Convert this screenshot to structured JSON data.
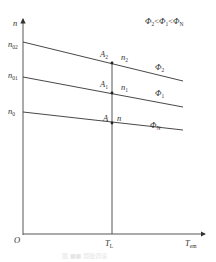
{
  "diagram": {
    "type": "mechanical-characteristic-curves",
    "axes": {
      "y_label": "n",
      "x_label_main": "T",
      "x_label_sub": "em",
      "origin_label": "O"
    },
    "legend": {
      "inequality": "Φ2 < Φ1 < ΦN",
      "parts": [
        "Φ",
        "2",
        "<",
        "Φ",
        "1",
        "<",
        "Φ",
        "N"
      ]
    },
    "y_ticks": [
      {
        "main": "n",
        "sub": "02"
      },
      {
        "main": "n",
        "sub": "01"
      },
      {
        "main": "n",
        "sub": "0"
      }
    ],
    "x_ticks": [
      {
        "main": "T",
        "sub": "L"
      }
    ],
    "curves": [
      {
        "name": "Φ",
        "sub": "2",
        "point": "A",
        "point_sub": "2",
        "speed": "n",
        "speed_sub": "2",
        "color": "#333333"
      },
      {
        "name": "Φ",
        "sub": "1",
        "point": "A",
        "point_sub": "1",
        "speed": "n",
        "speed_sub": "1",
        "color": "#333333"
      },
      {
        "name": "Φ",
        "sub": "N",
        "point": "A",
        "point_sub": "",
        "speed": "n",
        "speed_sub": "",
        "color": "#333333"
      }
    ],
    "caption": "图 ■■ 弱磁调速"
  }
}
